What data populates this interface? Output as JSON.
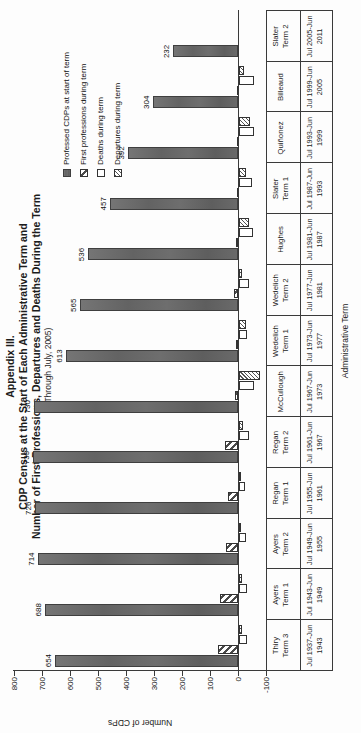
{
  "title": {
    "line1": "Appendix III.",
    "line2": "CDP Census at the Start of Each Administrative Term and",
    "line3": "Number of First Professions, Departures and Deaths During the Term",
    "subtitle": "(Through July, 2005)"
  },
  "y_axis": {
    "title": "Number of CDPs",
    "ticks": [
      800,
      700,
      600,
      500,
      400,
      300,
      200,
      100,
      0,
      -100
    ]
  },
  "x_axis": {
    "title": "Administrative Term"
  },
  "legend": {
    "items": [
      {
        "label": "Professed CDPs at start of term",
        "pattern": "solid-dark"
      },
      {
        "label": "First professions during term",
        "pattern": "hatch-wide"
      },
      {
        "label": "Deaths during term",
        "pattern": "white"
      },
      {
        "label": "Departures during term",
        "pattern": "hatch-fine"
      }
    ]
  },
  "chart_data": {
    "type": "bar",
    "orientation_note": "landscape chart rotated 90 degrees counterclockwise in the screenshot",
    "ylim": [
      -100,
      800
    ],
    "grid": false,
    "legend_position": "inside-plot-upper-right",
    "categories": [
      {
        "term": "Thiry Term 3",
        "term_lines": [
          "Thiry",
          "Term 3"
        ],
        "dates": "Jul 1937-Jun 1943",
        "date_lines": [
          "Jul 1937-Jun",
          "1943"
        ]
      },
      {
        "term": "Ayers Term 1",
        "term_lines": [
          "Ayers",
          "Term 1"
        ],
        "dates": "Jul 1943-Jun 1949",
        "date_lines": [
          "Jul 1943-Jun",
          "1949"
        ]
      },
      {
        "term": "Ayers Term 2",
        "term_lines": [
          "Ayers",
          "Term 2"
        ],
        "dates": "Jul 1949-Jun 1955",
        "date_lines": [
          "Jul 1949-Jun",
          "1955"
        ]
      },
      {
        "term": "Regan Term 1",
        "term_lines": [
          "Regan",
          "Term 1"
        ],
        "dates": "Jul 1955-Jun 1961",
        "date_lines": [
          "Jul 1955-Jun",
          "1961"
        ]
      },
      {
        "term": "Regan Term 2",
        "term_lines": [
          "Regan",
          "Term 2"
        ],
        "dates": "Jul 1961-Jun 1967",
        "date_lines": [
          "Jul 1961-Jun",
          "1967"
        ]
      },
      {
        "term": "McCullough",
        "term_lines": [
          "McCullough"
        ],
        "dates": "Jul 1967-Jun 1973",
        "date_lines": [
          "Jul 1967-Jun",
          "1973"
        ]
      },
      {
        "term": "Wedelich Term 1",
        "term_lines": [
          "Wedelich",
          "Term 1"
        ],
        "dates": "Jul 1973-Jun 1977",
        "date_lines": [
          "Jul 1973-Jun",
          "1977"
        ]
      },
      {
        "term": "Wedelich Term 2",
        "term_lines": [
          "Wedelich",
          "Term 2"
        ],
        "dates": "Jul 1977-Jun 1981",
        "date_lines": [
          "Jul 1977-Jun",
          "1981"
        ]
      },
      {
        "term": "Hughes",
        "term_lines": [
          "Hughes"
        ],
        "dates": "Jul 1981-Jun 1987",
        "date_lines": [
          "Jul 1981-Jun",
          "1987"
        ]
      },
      {
        "term": "Slater Term 1",
        "term_lines": [
          "Slater",
          "Term 1"
        ],
        "dates": "Jul 1987-Jun 1993",
        "date_lines": [
          "Jul 1987-Jun",
          "1993"
        ]
      },
      {
        "term": "Quiñonez",
        "term_lines": [
          "Quiñonez"
        ],
        "dates": "Jul 1993-Jun 1999",
        "date_lines": [
          "Jul 1993-Jun",
          "1999"
        ]
      },
      {
        "term": "Billeaud",
        "term_lines": [
          "Billeaud"
        ],
        "dates": "Jul 1999-Jun 2005",
        "date_lines": [
          "Jul 1999-Jun",
          "2005"
        ]
      },
      {
        "term": "Slater Term 2",
        "term_lines": [
          "Slater",
          "Term 2"
        ],
        "dates": "Jul 2005-Jun 2011",
        "date_lines": [
          "Jul 2005-Jun",
          "2011"
        ]
      }
    ],
    "series": [
      {
        "name": "Professed CDPs at start of term",
        "pattern": "solid-dark",
        "data_labels": true,
        "values": [
          654,
          688,
          714,
          726,
          733,
          730,
          613,
          565,
          536,
          457,
          392,
          304,
          232
        ]
      },
      {
        "name": "First professions during term",
        "pattern": "hatch-wide",
        "data_labels": false,
        "estimated": true,
        "values": [
          73,
          65,
          42,
          35,
          45,
          10,
          8,
          15,
          8,
          5,
          3,
          2,
          0
        ]
      },
      {
        "name": "Deaths during term",
        "pattern": "white",
        "data_labels": false,
        "estimated": true,
        "values": [
          -30,
          -30,
          -24,
          -21,
          -34,
          -52,
          -30,
          -34,
          -50,
          -46,
          -52,
          -55,
          0
        ]
      },
      {
        "name": "Departures during term",
        "pattern": "hatch-fine",
        "data_labels": false,
        "estimated": true,
        "values": [
          -9,
          -9,
          -6,
          -7,
          -14,
          -75,
          -26,
          -10,
          -37,
          -24,
          -39,
          -19,
          0
        ]
      }
    ]
  },
  "colors": {
    "bar_dark": "#6a6a6a",
    "axis": "#3a3a3a",
    "text": "#1c1c1c",
    "background": "#fdfdfd"
  }
}
